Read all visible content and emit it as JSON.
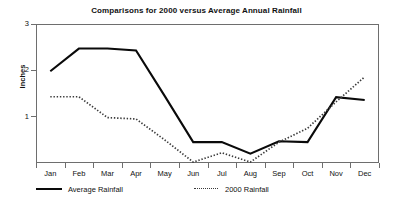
{
  "chart_data": {
    "type": "line",
    "title": "Comparisons for 2000 versus Average Annual Rainfall",
    "xlabel": "",
    "ylabel": "Inches",
    "categories": [
      "Jan",
      "Feb",
      "Mar",
      "Apr",
      "May",
      "Jun",
      "Jul",
      "Aug",
      "Sep",
      "Oct",
      "Nov",
      "Dec"
    ],
    "ylim": [
      0,
      3
    ],
    "yticks": [
      1,
      2,
      3
    ],
    "ytick_labels": [
      "1",
      "2",
      "3"
    ],
    "grid": false,
    "legend_position": "bottom",
    "series": [
      {
        "name": "Average Rainfall",
        "style": "solid",
        "color": "#0a0a0a",
        "values": [
          1.98,
          2.47,
          2.47,
          2.43,
          1.45,
          0.45,
          0.45,
          0.2,
          0.47,
          0.45,
          1.42,
          1.36
        ]
      },
      {
        "name": "2000 Rainfall",
        "style": "dotted",
        "color": "#3a3a3a",
        "values": [
          1.43,
          1.43,
          0.98,
          0.95,
          0.5,
          0.02,
          0.22,
          0.02,
          0.45,
          0.75,
          1.32,
          1.86
        ]
      }
    ]
  },
  "legend": {
    "entries": [
      {
        "label": "Average Rainfall"
      },
      {
        "label": "2000 Rainfall"
      }
    ]
  },
  "footer": {
    "partial_text": ""
  }
}
